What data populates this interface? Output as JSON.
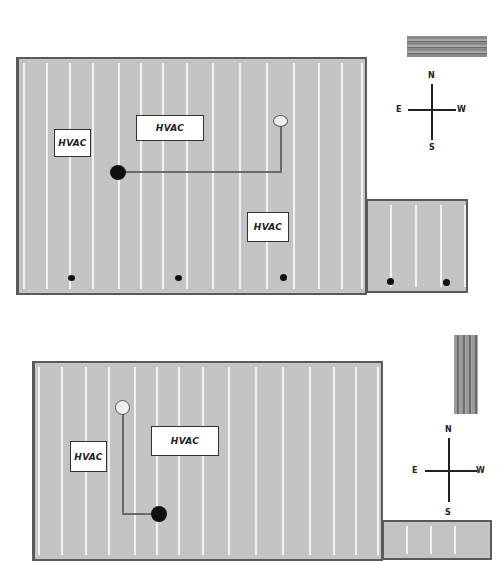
{
  "colors": {
    "roof_fill": "#c4c4c4",
    "roof_border": "#5a5a5a",
    "stripe": "#f2f2f2",
    "pipe": "#6a6a6a",
    "drain_dot": "#111111",
    "vent_dot": "#eeeeee"
  },
  "plan_top": {
    "label_units": [
      "HVAC",
      "HVAC",
      "HVAC"
    ],
    "compass": {
      "north": "N",
      "south": "S",
      "east": "E",
      "west": "W"
    },
    "swatch_orientation": "horizontal"
  },
  "plan_bottom": {
    "label_units": [
      "HVAC",
      "HVAC"
    ],
    "compass": {
      "north": "N",
      "south": "S",
      "east": "E",
      "west": "W"
    },
    "swatch_orientation": "vertical"
  }
}
